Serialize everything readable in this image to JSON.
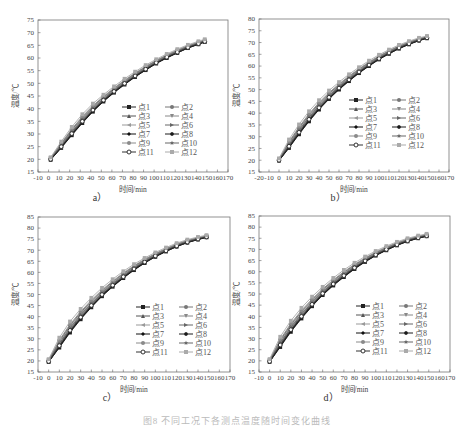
{
  "figure": {
    "caption": "图8 不同工况下各测点温度随时间变化曲线",
    "panels": [
      {
        "id": "a",
        "label": "a）"
      },
      {
        "id": "b",
        "label": "b）"
      },
      {
        "id": "c",
        "label": "c）"
      },
      {
        "id": "d",
        "label": "d）"
      }
    ]
  },
  "chart_data": [
    {
      "panel": "a",
      "type": "line",
      "title": "",
      "xlabel": "时间/min",
      "ylabel": "温度/℃",
      "xlim": [
        -10,
        170
      ],
      "ylim": [
        15,
        75
      ],
      "xticks": [
        -10,
        0,
        10,
        20,
        30,
        40,
        50,
        60,
        70,
        80,
        90,
        100,
        110,
        120,
        130,
        140,
        150,
        160,
        170
      ],
      "yticks": [
        15,
        20,
        25,
        30,
        35,
        40,
        45,
        50,
        55,
        60,
        65,
        70,
        75
      ],
      "grid": false,
      "legend_position": "lower-right inside",
      "x": [
        2,
        12,
        22,
        32,
        42,
        52,
        62,
        72,
        82,
        92,
        102,
        112,
        122,
        132,
        142,
        148
      ],
      "band": {
        "lower": [
          19.8,
          24.5,
          29.5,
          34.3,
          38.8,
          42.8,
          46.3,
          49.5,
          52.5,
          55.2,
          57.8,
          60.0,
          62.0,
          63.9,
          65.4,
          66.3
        ],
        "upper": [
          20.8,
          27.0,
          32.8,
          37.8,
          42.0,
          45.5,
          48.8,
          51.8,
          54.6,
          57.2,
          59.5,
          61.6,
          63.5,
          65.2,
          66.6,
          67.4
        ]
      },
      "series": [
        {
          "name": "点1",
          "offset": 0.0
        },
        {
          "name": "点2",
          "offset": 0.15
        },
        {
          "name": "点3",
          "offset": 0.3
        },
        {
          "name": "点4",
          "offset": 0.45
        },
        {
          "name": "点5",
          "offset": 0.55
        },
        {
          "name": "点6",
          "offset": 0.65
        },
        {
          "name": "点7",
          "offset": 0.1
        },
        {
          "name": "点8",
          "offset": 0.05
        },
        {
          "name": "点9",
          "offset": 0.75
        },
        {
          "name": "点10",
          "offset": 0.4
        },
        {
          "name": "点11",
          "offset": 0.2
        },
        {
          "name": "点12",
          "offset": 1.0
        }
      ]
    },
    {
      "panel": "b",
      "type": "line",
      "title": "",
      "xlabel": "时间/min",
      "ylabel": "温度/℃",
      "xlim": [
        -20,
        170
      ],
      "ylim": [
        15,
        80
      ],
      "xticks": [
        -20,
        -10,
        0,
        10,
        20,
        30,
        40,
        50,
        60,
        70,
        80,
        90,
        100,
        110,
        120,
        130,
        140,
        150,
        160,
        170
      ],
      "yticks": [
        15,
        20,
        25,
        30,
        35,
        40,
        45,
        50,
        55,
        60,
        65,
        70,
        75,
        80
      ],
      "grid": false,
      "legend_position": "lower-right inside",
      "x": [
        0,
        10,
        20,
        30,
        40,
        50,
        60,
        70,
        80,
        90,
        100,
        110,
        120,
        130,
        140,
        148
      ],
      "band": {
        "lower": [
          19.8,
          25.2,
          31.0,
          36.5,
          41.5,
          46.0,
          50.0,
          53.6,
          57.0,
          60.0,
          62.8,
          65.2,
          67.4,
          69.2,
          70.8,
          71.8
        ],
        "upper": [
          20.8,
          28.8,
          35.2,
          40.8,
          45.5,
          49.6,
          53.2,
          56.5,
          59.5,
          62.3,
          64.8,
          67.0,
          69.0,
          70.6,
          72.0,
          72.8
        ]
      },
      "series": [
        {
          "name": "点1",
          "offset": 0.0
        },
        {
          "name": "点2",
          "offset": 0.15
        },
        {
          "name": "点3",
          "offset": 0.3
        },
        {
          "name": "点4",
          "offset": 0.45
        },
        {
          "name": "点5",
          "offset": 0.55
        },
        {
          "name": "点6",
          "offset": 0.65
        },
        {
          "name": "点7",
          "offset": 0.1
        },
        {
          "name": "点8",
          "offset": 0.05
        },
        {
          "name": "点9",
          "offset": 0.75
        },
        {
          "name": "点10",
          "offset": 0.4
        },
        {
          "name": "点11",
          "offset": 0.2
        },
        {
          "name": "点12",
          "offset": 1.0
        }
      ]
    },
    {
      "panel": "c",
      "type": "line",
      "title": "",
      "xlabel": "时间/min",
      "ylabel": "温度/℃",
      "xlim": [
        -10,
        170
      ],
      "ylim": [
        15,
        85
      ],
      "xticks": [
        -10,
        0,
        10,
        20,
        30,
        40,
        50,
        60,
        70,
        80,
        90,
        100,
        110,
        120,
        130,
        140,
        150,
        160,
        170
      ],
      "yticks": [
        15,
        20,
        25,
        30,
        35,
        40,
        45,
        50,
        55,
        60,
        65,
        70,
        75,
        80,
        85
      ],
      "grid": false,
      "legend_position": "lower-right inside",
      "x": [
        0,
        10,
        20,
        30,
        40,
        50,
        60,
        70,
        80,
        90,
        100,
        110,
        120,
        130,
        140,
        148
      ],
      "band": {
        "lower": [
          19.5,
          26.0,
          32.8,
          38.8,
          44.2,
          49.2,
          53.5,
          57.4,
          61.0,
          64.2,
          67.0,
          69.4,
          71.6,
          73.4,
          74.8,
          75.8
        ],
        "upper": [
          20.8,
          30.5,
          37.8,
          43.5,
          48.5,
          53.0,
          56.9,
          60.5,
          63.7,
          66.5,
          69.0,
          71.2,
          73.2,
          74.8,
          76.0,
          76.8
        ]
      },
      "series": [
        {
          "name": "点1",
          "offset": 0.0
        },
        {
          "name": "点2",
          "offset": 0.15
        },
        {
          "name": "点3",
          "offset": 0.3
        },
        {
          "name": "点4",
          "offset": 0.45
        },
        {
          "name": "点5",
          "offset": 0.55
        },
        {
          "name": "点6",
          "offset": 0.65
        },
        {
          "name": "点7",
          "offset": 0.1
        },
        {
          "name": "点8",
          "offset": 0.05
        },
        {
          "name": "点9",
          "offset": 0.75
        },
        {
          "name": "点10",
          "offset": 0.4
        },
        {
          "name": "点11",
          "offset": 0.2
        },
        {
          "name": "点12",
          "offset": 1.0
        }
      ]
    },
    {
      "panel": "d",
      "type": "line",
      "title": "",
      "xlabel": "时间/min",
      "ylabel": "温度/℃",
      "xlim": [
        -10,
        170
      ],
      "ylim": [
        15,
        85
      ],
      "xticks": [
        -10,
        0,
        10,
        20,
        30,
        40,
        50,
        60,
        70,
        80,
        90,
        100,
        110,
        120,
        130,
        140,
        150,
        160,
        170
      ],
      "yticks": [
        15,
        20,
        25,
        30,
        35,
        40,
        45,
        50,
        55,
        60,
        65,
        70,
        75,
        80,
        85
      ],
      "grid": false,
      "legend_position": "lower-right inside",
      "x": [
        0,
        10,
        20,
        30,
        40,
        50,
        60,
        70,
        80,
        90,
        100,
        110,
        120,
        130,
        140,
        148
      ],
      "band": {
        "lower": [
          19.5,
          26.2,
          33.0,
          39.0,
          44.5,
          49.5,
          53.8,
          57.6,
          61.2,
          64.4,
          67.2,
          69.6,
          71.8,
          73.6,
          75.0,
          75.9
        ],
        "upper": [
          20.8,
          30.8,
          38.0,
          43.8,
          48.8,
          53.2,
          57.2,
          60.8,
          64.0,
          66.8,
          69.3,
          71.5,
          73.4,
          75.0,
          76.2,
          77.0
        ]
      },
      "series": [
        {
          "name": "点1",
          "offset": 0.0
        },
        {
          "name": "点2",
          "offset": 0.15
        },
        {
          "name": "点3",
          "offset": 0.3
        },
        {
          "name": "点4",
          "offset": 0.45
        },
        {
          "name": "点5",
          "offset": 0.55
        },
        {
          "name": "点6",
          "offset": 0.65
        },
        {
          "name": "点7",
          "offset": 0.1
        },
        {
          "name": "点8",
          "offset": 0.05
        },
        {
          "name": "点9",
          "offset": 0.75
        },
        {
          "name": "点10",
          "offset": 0.4
        },
        {
          "name": "点11",
          "offset": 0.2
        },
        {
          "name": "点12",
          "offset": 1.0
        }
      ]
    }
  ],
  "legend": {
    "entries": [
      {
        "name": "点1",
        "marker": "square",
        "color": "#222222"
      },
      {
        "name": "点2",
        "marker": "circle",
        "color": "#777777"
      },
      {
        "name": "点3",
        "marker": "triangle-up",
        "color": "#555555"
      },
      {
        "name": "点4",
        "marker": "triangle-down",
        "color": "#888888"
      },
      {
        "name": "点5",
        "marker": "triangle-left",
        "color": "#999999"
      },
      {
        "name": "点6",
        "marker": "triangle-right",
        "color": "#666666"
      },
      {
        "name": "点7",
        "marker": "diamond",
        "color": "#111111"
      },
      {
        "name": "点8",
        "marker": "hexagon",
        "color": "#1a1a1a"
      },
      {
        "name": "点9",
        "marker": "circle",
        "color": "#8a8a8a"
      },
      {
        "name": "点10",
        "marker": "star",
        "color": "#666666"
      },
      {
        "name": "点11",
        "marker": "circle-open",
        "color": "#333333"
      },
      {
        "name": "点12",
        "marker": "square",
        "color": "#aaaaaa"
      }
    ]
  },
  "layout": {
    "panels": [
      {
        "id": "a",
        "left": 0,
        "top": 0,
        "frame": {
          "x0": 38,
          "y0": 20,
          "x1": 228,
          "y1": 172
        },
        "label_x": 100,
        "label_y": 197
      },
      {
        "id": "b",
        "left": 0,
        "top": 0,
        "frame": {
          "x0": 259,
          "y0": 19,
          "x1": 449,
          "y1": 172
        },
        "label_x": 338,
        "label_y": 197
      },
      {
        "id": "c",
        "left": 0,
        "top": 0,
        "frame": {
          "x0": 38,
          "y0": 217,
          "x1": 230,
          "y1": 372
        },
        "label_x": 110,
        "label_y": 397
      },
      {
        "id": "d",
        "left": 0,
        "top": 0,
        "frame": {
          "x0": 259,
          "y0": 216,
          "x1": 450,
          "y1": 372
        },
        "label_x": 331,
        "label_y": 397
      }
    ],
    "legend_origin": [
      {
        "x": 122,
        "y": 107
      },
      {
        "x": 349,
        "y": 100
      },
      {
        "x": 136,
        "y": 307
      },
      {
        "x": 356,
        "y": 306
      }
    ]
  }
}
